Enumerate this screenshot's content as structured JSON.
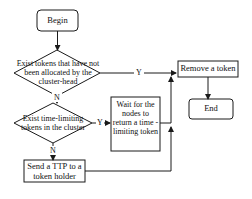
{
  "diagram": {
    "nodes": {
      "begin": "Begin",
      "decision1": "Exist tokens that have not been allocated by the cluster-head",
      "decision2": "Exist time-limiting tokens in the cluster",
      "wait": "Wait for the nodes to return a time -limiting token",
      "send_ttp": "Send a TTP to a token holder",
      "remove": "Remove a token",
      "end": "End"
    },
    "edge_labels": {
      "d1_yes": "Y",
      "d1_no": "N",
      "d2_yes": "Y",
      "d2_no": "N"
    },
    "colors": {
      "stroke": "#1a1a1a",
      "background": "#ffffff"
    }
  }
}
